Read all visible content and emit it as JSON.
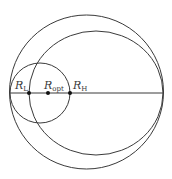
{
  "diagram": {
    "colors": {
      "stroke": "#3a3a3a",
      "background": "#ffffff",
      "dot": "#111111"
    },
    "points": [
      {
        "id": "RL",
        "symbol": "R",
        "subscript": "L"
      },
      {
        "id": "Ropt",
        "symbol": "R",
        "subscript": "opt"
      },
      {
        "id": "RH",
        "symbol": "R",
        "subscript": "H"
      }
    ],
    "circles": [
      {
        "id": "outer-circle"
      },
      {
        "id": "middle-circle"
      },
      {
        "id": "small-circle"
      }
    ],
    "axis": {
      "id": "horizontal-axis"
    }
  }
}
